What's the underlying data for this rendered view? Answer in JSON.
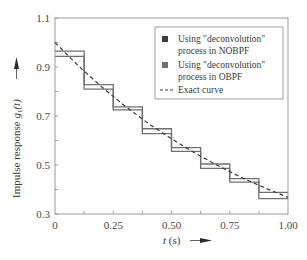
{
  "chart_data": {
    "type": "line",
    "title": "",
    "xlabel": "t (s)",
    "ylabel": "Impulse response g1(t)",
    "ylabel_main": "Impulse response ",
    "ylabel_g": "g",
    "ylabel_sub": "1",
    "ylabel_arg": "(t)",
    "xlabel_t": "t",
    "xlabel_unit": " (s)",
    "xlim": [
      0,
      1.0
    ],
    "ylim": [
      0.3,
      1.1
    ],
    "x_ticks": [
      "0",
      "0.25",
      "0.50",
      "0.75",
      "1.00"
    ],
    "x_tick_values": [
      0,
      0.25,
      0.5,
      0.75,
      1.0
    ],
    "x_minor_ticks": [
      0.125,
      0.25,
      0.375,
      0.5,
      0.625,
      0.75,
      0.875
    ],
    "y_ticks": [
      "0.3",
      "0.5",
      "0.7",
      "0.9",
      "1.1"
    ],
    "y_tick_values": [
      0.3,
      0.5,
      0.7,
      0.9,
      1.1
    ],
    "y_minor_ticks": [
      0.4,
      0.6,
      0.8,
      1.0
    ],
    "grid": false,
    "legend_position": "upper right",
    "step_edges": [
      0,
      0.125,
      0.25,
      0.375,
      0.5,
      0.625,
      0.75,
      0.875,
      1.0
    ],
    "series": [
      {
        "name": "Using \"deconvolution\" process in NOBPF",
        "legend_lines": [
          "Using \"deconvolution\"",
          "process in NOBPF"
        ],
        "style": "staircase",
        "marker_color": "#3c3c3c",
        "line_color": "#707070",
        "values": [
          0.965,
          0.828,
          0.737,
          0.648,
          0.571,
          0.504,
          0.444,
          0.388
        ]
      },
      {
        "name": "Using \"deconvolution\" process in OBPF",
        "legend_lines": [
          "Using \"deconvolution\"",
          "process in OBPF"
        ],
        "style": "staircase",
        "marker_color": "#6e6e6e",
        "line_color": "#707070",
        "values": [
          0.943,
          0.81,
          0.725,
          0.628,
          0.556,
          0.486,
          0.43,
          0.363
        ]
      },
      {
        "name": "Exact curve",
        "legend_lines": [
          "Exact curve"
        ],
        "style": "dashed",
        "line_color": "#3a3a3a",
        "x": [
          0,
          0.1,
          0.2,
          0.3,
          0.4,
          0.5,
          0.6,
          0.7,
          0.8,
          0.9,
          1.0
        ],
        "values": [
          1.0,
          0.905,
          0.819,
          0.741,
          0.67,
          0.607,
          0.549,
          0.497,
          0.449,
          0.407,
          0.368
        ]
      }
    ]
  }
}
